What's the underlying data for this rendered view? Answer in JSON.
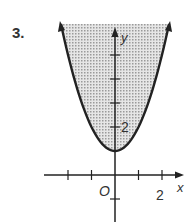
{
  "problem": {
    "number": "3."
  },
  "chart_data": {
    "type": "area",
    "title": "",
    "function": "y = x^2 + 1",
    "inequality": "y >= x^2 + 1",
    "shading": "above curve (inside parabola)",
    "boundary": "solid",
    "xlabel": "x",
    "ylabel": "y",
    "origin_label": "O",
    "x_tick_labels": [
      {
        "value": 2,
        "label": "2"
      }
    ],
    "y_tick_labels": [
      {
        "value": 2,
        "label": "2"
      }
    ],
    "x_ticks": [
      -2,
      -1,
      1,
      2
    ],
    "y_ticks": [
      -1,
      2,
      3,
      4,
      5
    ],
    "xlim": [
      -2.3,
      2.3
    ],
    "ylim": [
      -2,
      6.2
    ],
    "vertex": [
      0,
      1
    ],
    "x": [
      -2.3,
      -2,
      -1,
      0,
      1,
      2,
      2.3
    ],
    "values": [
      6.29,
      5,
      2,
      1,
      2,
      5,
      6.29
    ],
    "grid": false
  },
  "colors": {
    "curve": "#222222",
    "shade": "#c8c8c8",
    "axis": "#222222"
  }
}
